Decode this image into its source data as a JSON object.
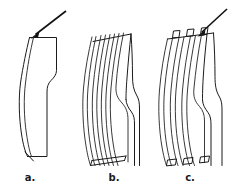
{
  "figure": {
    "background_color": "#ffffff",
    "line_color": "#1b1b1b",
    "arrow_color": "#111111",
    "width": 235,
    "height": 189,
    "panel_count": 3
  },
  "panels": [
    {
      "id": "a",
      "label": "a.",
      "label_x": 30,
      "label_y": 180,
      "has_arrow": true,
      "arrow_target": "top-left-edge",
      "layers": 1,
      "style": "single outlined band with bend"
    },
    {
      "id": "b",
      "label": "b.",
      "label_x": 114,
      "label_y": 180,
      "has_arrow": false,
      "arrow_target": "",
      "layers": 6,
      "style": "six stacked parallel laminae, sheared ends"
    },
    {
      "id": "c",
      "label": "c.",
      "label_x": 190,
      "label_y": 180,
      "has_arrow": true,
      "arrow_target": "top-of-lamina-stack",
      "layers": 6,
      "style": "six stacked laminae with squared end blocks"
    }
  ],
  "labels": {
    "a": "a.",
    "b": "b.",
    "c": "c."
  },
  "arrows": [
    {
      "name": "load-arrow-a",
      "from_x": 66,
      "from_y": 11,
      "to_x": 31,
      "to_y": 38
    },
    {
      "name": "load-arrow-c",
      "from_x": 226,
      "from_y": 10,
      "to_x": 198,
      "to_y": 36
    }
  ]
}
